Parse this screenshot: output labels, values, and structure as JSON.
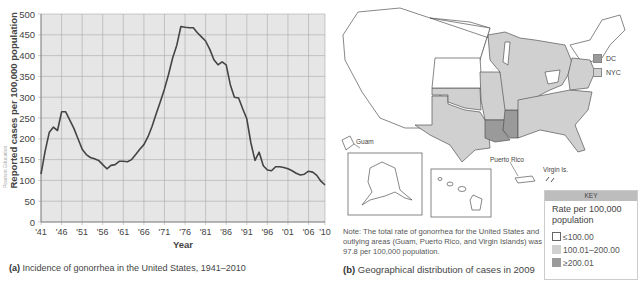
{
  "chart_data": {
    "type": "line",
    "title": "Incidence of gonorrhea in the United States, 1941–2010",
    "panel_label": "(a)",
    "xlabel": "Year",
    "ylabel": "Reported cases per 100,000 population",
    "ylim": [
      0,
      500
    ],
    "xlim": [
      1941,
      2010
    ],
    "grid": true,
    "yticks": [
      0,
      50,
      100,
      150,
      200,
      250,
      300,
      350,
      400,
      450,
      500
    ],
    "xtick_labels": [
      "'41",
      "'46",
      "'51",
      "'56",
      "'61",
      "'66",
      "'71",
      "'76",
      "'81",
      "'86",
      "'91",
      "'96",
      "'01",
      "'06",
      "'10"
    ],
    "xtick_years": [
      1941,
      1946,
      1951,
      1956,
      1961,
      1966,
      1971,
      1976,
      1981,
      1986,
      1991,
      1996,
      2001,
      2006,
      2010
    ],
    "series": [
      {
        "name": "Gonorrhea incidence",
        "color": "#444444",
        "x": [
          1941,
          1942,
          1943,
          1944,
          1945,
          1946,
          1947,
          1948,
          1949,
          1950,
          1951,
          1952,
          1953,
          1954,
          1955,
          1956,
          1957,
          1958,
          1959,
          1960,
          1961,
          1962,
          1963,
          1964,
          1965,
          1966,
          1967,
          1968,
          1969,
          1970,
          1971,
          1972,
          1973,
          1974,
          1975,
          1976,
          1977,
          1978,
          1979,
          1980,
          1981,
          1982,
          1983,
          1984,
          1985,
          1986,
          1987,
          1988,
          1989,
          1990,
          1991,
          1992,
          1993,
          1994,
          1995,
          1996,
          1997,
          1998,
          1999,
          2000,
          2001,
          2002,
          2003,
          2004,
          2005,
          2006,
          2007,
          2008,
          2009,
          2010
        ],
        "values": [
          115,
          170,
          215,
          228,
          220,
          265,
          265,
          245,
          225,
          200,
          175,
          162,
          155,
          152,
          148,
          138,
          128,
          136,
          138,
          146,
          146,
          145,
          150,
          162,
          175,
          186,
          205,
          230,
          260,
          290,
          320,
          355,
          395,
          425,
          470,
          468,
          467,
          467,
          455,
          445,
          435,
          415,
          390,
          378,
          385,
          378,
          330,
          300,
          298,
          272,
          248,
          190,
          148,
          168,
          135,
          125,
          123,
          133,
          133,
          131,
          128,
          123,
          117,
          113,
          115,
          122,
          120,
          112,
          98,
          89
        ]
      }
    ]
  },
  "chart_a": {
    "panel_label": "(a)",
    "caption": "Incidence of gonorrhea in the United States, 1941–2010",
    "credit": "Pearson Education"
  },
  "map_b": {
    "panel_label": "(b)",
    "caption": "Geographical distribution of cases in 2009",
    "note": "Note: The total rate of gonorrhea for the United States and outlying areas (Guam, Puerto Rico, and Virgin Islands) was 97.8 per 100,000 population.",
    "labels": {
      "guam": "Guam",
      "puerto_rico": "Puerto Rico",
      "virgin_islands": "Virgin Is."
    },
    "inset_legend": [
      {
        "label": "DC",
        "color": "#9a9a9a"
      },
      {
        "label": "NYC",
        "color": "#d0d0d0"
      }
    ],
    "key": {
      "header": "KEY",
      "title": "Rate per 100,000 population",
      "items": [
        {
          "label": "≤100.00",
          "color": "#ffffff"
        },
        {
          "label": "100.01–200.00",
          "color": "#d0d0d0"
        },
        {
          "label": "≥200.01",
          "color": "#9a9a9a"
        }
      ]
    },
    "states_mid": [
      "TX",
      "OK",
      "AR",
      "MO",
      "IL",
      "WI",
      "MI",
      "IN",
      "OH",
      "KY",
      "TN",
      "AL",
      "GA",
      "FL",
      "SC",
      "NC",
      "VA",
      "MD",
      "DE",
      "NY",
      "AK"
    ],
    "states_high": [
      "LA",
      "MS"
    ]
  }
}
